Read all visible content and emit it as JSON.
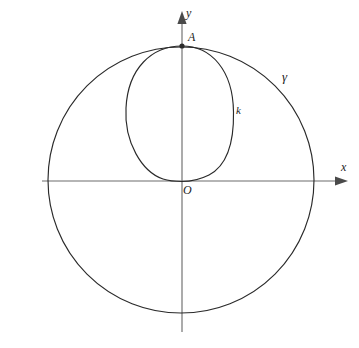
{
  "figure": {
    "background_color": "#ffffff",
    "curve_color": "#2a2a2a",
    "axis_color": "#6d6d6d",
    "label_color": "#1c1c1c",
    "axes": {
      "y_axis_label": "y",
      "x_axis_label": "x",
      "origin_label": "O",
      "x_axis_y_pixel": 181,
      "y_axis_x_pixel": 182,
      "x_axis_start_pixel": 42,
      "x_axis_end_pixel": 348,
      "y_axis_start_pixel": 12,
      "y_axis_end_pixel": 332
    },
    "points": [
      {
        "name": "A",
        "label": "A",
        "description": "top vertex where circle gamma and curve k meet on the y-axis",
        "x_pixel": 182,
        "y_pixel": 46
      },
      {
        "name": "O",
        "label": "O",
        "description": "origin, tangency point of curve k with the x-axis",
        "x_pixel": 182,
        "y_pixel": 181
      }
    ],
    "curves": [
      {
        "name": "gamma",
        "label": "γ",
        "type": "circle",
        "description": "large circle passing through A at the top",
        "center_x_pixel": 181,
        "center_y_pixel": 180,
        "radius_pixel": 133,
        "label_x_pixel": 282,
        "label_y_pixel": 70
      },
      {
        "name": "k",
        "label": "k",
        "type": "oval",
        "description": "egg shaped closed curve from A down to O, tangent to the x-axis at O",
        "top_x_pixel": 182,
        "top_y_pixel": 46,
        "bottom_x_pixel": 182,
        "bottom_y_pixel": 181,
        "left_x_pixel": 125,
        "right_x_pixel": 234,
        "widest_y_pixel": 116,
        "label_x_pixel": 236,
        "label_y_pixel": 105
      }
    ]
  }
}
